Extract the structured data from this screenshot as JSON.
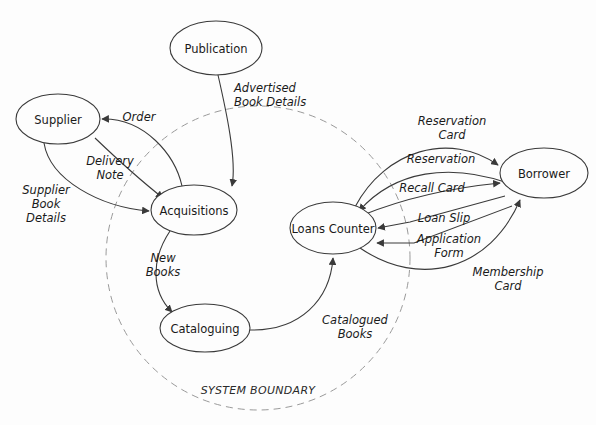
{
  "diagram": {
    "type": "data-flow-diagram",
    "boundary": {
      "label": "SYSTEM BOUNDARY",
      "style": "dashed",
      "color": "#9a9a9a",
      "cx": 258,
      "cy": 258,
      "rx": 152,
      "ry": 152
    },
    "colors": {
      "stroke": "#3a3a3a",
      "text": "#1a1a1a",
      "background": "#fdfdfd",
      "boundary": "#9a9a9a"
    },
    "nodes": [
      {
        "id": "publication",
        "label": "Publication",
        "cx": 216,
        "cy": 48,
        "rx": 46,
        "ry": 27,
        "inside_boundary": false
      },
      {
        "id": "supplier",
        "label": "Supplier",
        "cx": 58,
        "cy": 119,
        "rx": 42,
        "ry": 25,
        "inside_boundary": false
      },
      {
        "id": "acquisitions",
        "label": "Acquisitions",
        "cx": 194,
        "cy": 210,
        "rx": 43,
        "ry": 25,
        "inside_boundary": true
      },
      {
        "id": "cataloguing",
        "label": "Cataloguing",
        "cx": 205,
        "cy": 328,
        "rx": 45,
        "ry": 24,
        "inside_boundary": true
      },
      {
        "id": "loans_counter",
        "label": "Loans Counter",
        "cx": 333,
        "cy": 228,
        "rx": 43,
        "ry": 26,
        "inside_boundary": true
      },
      {
        "id": "borrower",
        "label": "Borrower",
        "cx": 544,
        "cy": 173,
        "rx": 44,
        "ry": 25,
        "inside_boundary": false
      }
    ],
    "flows": [
      {
        "id": "advertised-book-details",
        "from": "publication",
        "to": "acquisitions",
        "label": "Advertised\nBook Details",
        "label_x": 234,
        "label_y": 88
      },
      {
        "id": "order",
        "from": "acquisitions",
        "to": "supplier",
        "label": "Order",
        "label_x": 139,
        "label_y": 117
      },
      {
        "id": "delivery-note",
        "from": "supplier",
        "to": "acquisitions",
        "label": "Delivery\nNote",
        "label_x": 110,
        "label_y": 161
      },
      {
        "id": "supplier-book-details",
        "from": "supplier",
        "to": "acquisitions",
        "label": "Supplier\nBook\nDetails",
        "label_x": 46,
        "label_y": 190
      },
      {
        "id": "new-books",
        "from": "acquisitions",
        "to": "cataloguing",
        "label": "New\nBooks",
        "label_x": 163,
        "label_y": 258
      },
      {
        "id": "catalogued-books",
        "from": "cataloguing",
        "to": "loans_counter",
        "label": "Catalogued\nBooks",
        "label_x": 355,
        "label_y": 320
      },
      {
        "id": "reservation-card",
        "from": "loans_counter",
        "to": "borrower",
        "label": "Reservation\nCard",
        "label_x": 452,
        "label_y": 121
      },
      {
        "id": "reservation",
        "from": "borrower",
        "to": "loans_counter",
        "label": "Reservation",
        "label_x": 441,
        "label_y": 159
      },
      {
        "id": "recall-card",
        "from": "loans_counter",
        "to": "borrower",
        "label": "Recall Card",
        "label_x": 432,
        "label_y": 188
      },
      {
        "id": "loan-slip",
        "from": "loans_counter",
        "to": "borrower",
        "label": "Loan Slip",
        "label_x": 444,
        "label_y": 218
      },
      {
        "id": "application-form",
        "from": "borrower",
        "to": "loans_counter",
        "label": "Application\nForm",
        "label_x": 449,
        "label_y": 239
      },
      {
        "id": "membership-card",
        "from": "loans_counter",
        "to": "borrower",
        "label": "Membership\nCard",
        "label_x": 508,
        "label_y": 272
      }
    ]
  }
}
